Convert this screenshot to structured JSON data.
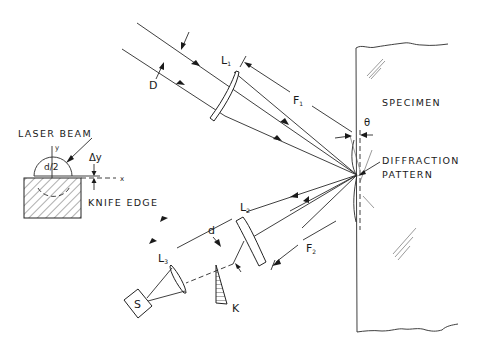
{
  "figure": {
    "labels": {
      "laser_beam": "LASER BEAM",
      "knife_edge": "KNIFE EDGE",
      "specimen": "SPECIMEN",
      "diffraction_line1": "DIFFRACTION",
      "diffraction_line2": "PATTERN",
      "d_half": "d/2",
      "delta_y": "Δy",
      "axis_x": "x",
      "axis_y": "y",
      "beam_diameter": "D",
      "lens1": "L",
      "lens1_sub": "1",
      "lens2": "L",
      "lens2_sub": "2",
      "lens3": "L",
      "lens3_sub": "3",
      "focal1": "F",
      "focal1_sub": "1",
      "focal2": "F",
      "focal2_sub": "2",
      "theta": "θ",
      "beam_d": "d",
      "knife": "K",
      "source": "S"
    },
    "components": [
      {
        "id": "lens1",
        "name": "L1",
        "role": "focusing lens for incident beam"
      },
      {
        "id": "lens2",
        "name": "L2",
        "role": "collecting lens for diffracted beam"
      },
      {
        "id": "lens3",
        "name": "L3",
        "role": "lens focusing onto detector"
      },
      {
        "id": "knife",
        "name": "K",
        "role": "knife edge"
      },
      {
        "id": "source",
        "name": "S",
        "role": "detector/sensor"
      },
      {
        "id": "specimen",
        "name": "SPECIMEN",
        "role": "sample surface"
      }
    ]
  }
}
